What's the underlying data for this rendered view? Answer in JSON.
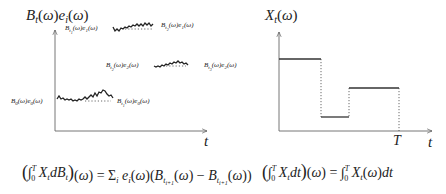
{
  "left_plot": {
    "y_axis_label": {
      "main": "B",
      "sub": "t",
      "rest": "(ω)e",
      "sub2": "i",
      "tail": "(ω)"
    },
    "x_axis_label": "t",
    "segments": [
      {
        "start_label": {
          "b": "B",
          "bsub": "0",
          "e": "e",
          "esub": "0"
        },
        "end_label": {
          "b": "B",
          "bsub": "t",
          "bsubsub": "1",
          "e": "e",
          "esub": "0"
        }
      },
      {
        "start_label": {
          "b": "B",
          "bsub": "t",
          "bsubsub": "1",
          "e": "e",
          "esub": "1"
        },
        "end_label": {
          "b": "B",
          "bsub": "t",
          "bsubsub": "2",
          "e": "e",
          "esub": "1"
        }
      },
      {
        "start_label": {
          "b": "B",
          "bsub": "t",
          "bsubsub": "2",
          "e": "e",
          "esub": "2"
        },
        "end_label": {
          "b": "B",
          "bsub": "t",
          "bsubsub": "3",
          "e": "e",
          "esub": "2"
        }
      }
    ]
  },
  "right_plot": {
    "y_axis_label": {
      "main": "X",
      "sub": "t",
      "rest": "(ω)"
    },
    "x_axis_label": "t",
    "terminal_label": "T",
    "steps": [
      {
        "x0": 0,
        "x1": 42,
        "level": 72
      },
      {
        "x0": 42,
        "x1": 70,
        "level": 14
      },
      {
        "x0": 70,
        "x1": 120,
        "level": 43
      }
    ]
  },
  "formulas": {
    "stochastic_integral": "(∫₀ᵀ XₜdBₜ)(ω) = Σᵢ eᵢ(ω)(B_{tᵢ₊₁}(ω) − B_{tᵢ₊₁}(ω))",
    "riemann_integral": "(∫₀ᵀ Xₜdt)(ω) = ∫₀ᵀ Xₜ(ω)dt"
  }
}
